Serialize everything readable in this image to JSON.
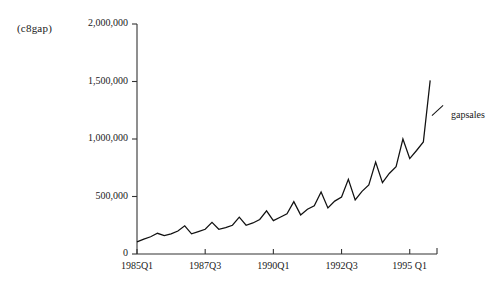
{
  "figure": {
    "corner_label": "(c8gap)",
    "legend": {
      "marker_icon": "line-segment-icon",
      "entries": [
        {
          "label": "gapsales",
          "color": "#111111"
        }
      ]
    }
  },
  "chart_data": {
    "type": "line",
    "title": "",
    "subtitle": "",
    "xlabel": "",
    "ylabel": "",
    "corner_label": "(c8gap)",
    "grid": false,
    "legend_position": "right",
    "series_name": "gapsales",
    "series_color": "#111111",
    "ylim": [
      0,
      2000000
    ],
    "ytick_values": [
      0,
      500000,
      1000000,
      1500000,
      2000000
    ],
    "ytick_labels": [
      "0",
      "500,000",
      "1,000,000",
      "1,500,000",
      "2,000,000"
    ],
    "xtick_labels": [
      "1985Q1",
      "1987Q3",
      "1990Q1",
      "1992Q3",
      "1995 Q1"
    ],
    "xtick_indices": [
      0,
      10,
      20,
      30,
      40
    ],
    "xlim_index": [
      0,
      44
    ],
    "x": [
      "1985Q1",
      "1985Q2",
      "1985Q3",
      "1985Q4",
      "1986Q1",
      "1986Q2",
      "1986Q3",
      "1986Q4",
      "1987Q1",
      "1987Q2",
      "1987Q3",
      "1987Q4",
      "1988Q1",
      "1988Q2",
      "1988Q3",
      "1988Q4",
      "1989Q1",
      "1989Q2",
      "1989Q3",
      "1989Q4",
      "1990Q1",
      "1990Q2",
      "1990Q3",
      "1990Q4",
      "1991Q1",
      "1991Q2",
      "1991Q3",
      "1991Q4",
      "1992Q1",
      "1992Q2",
      "1992Q3",
      "1992Q4",
      "1993Q1",
      "1993Q2",
      "1993Q3",
      "1993Q4",
      "1994Q1",
      "1994Q2",
      "1994Q3",
      "1994Q4",
      "1995Q1",
      "1995Q2",
      "1995Q3",
      "1995Q4"
    ],
    "values": [
      105000,
      130000,
      150000,
      180000,
      160000,
      175000,
      200000,
      245000,
      175000,
      195000,
      215000,
      275000,
      215000,
      230000,
      250000,
      320000,
      250000,
      270000,
      300000,
      375000,
      290000,
      320000,
      350000,
      455000,
      340000,
      390000,
      420000,
      540000,
      400000,
      460000,
      495000,
      650000,
      470000,
      545000,
      600000,
      800000,
      620000,
      700000,
      760000,
      1000000,
      830000,
      900000,
      975000,
      1510000
    ]
  }
}
